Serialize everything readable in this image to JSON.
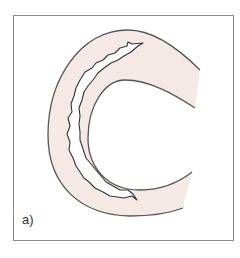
{
  "figure": {
    "panel_label": "a)",
    "colors": {
      "wall_fill": "#f4e9e4",
      "outline": "#555555",
      "crack_fill": "#ffffff",
      "frame": "#8a8a8a"
    },
    "elements": [
      {
        "name": "tube-wall",
        "shape": "C-shaped curved band, opening to the right"
      },
      {
        "name": "crack",
        "shape": "jagged elongated void within the wall following its curvature"
      }
    ]
  }
}
